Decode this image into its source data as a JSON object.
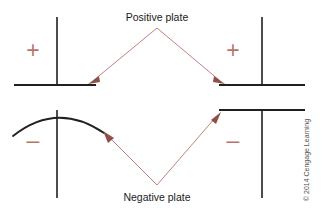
{
  "figure": {
    "title_top": "Positive plate",
    "title_bottom": "Negative plate",
    "credit": "© 2014 Cengage Learning",
    "colors": {
      "accent": "#b5756b",
      "arrow_head": "#8d4f47",
      "wire": "#231f20",
      "label": "#1a1a1a",
      "credit": "#55504e",
      "background": "#ffffff"
    }
  },
  "capacitors": [
    {
      "id": "left",
      "type": "polarized-capacitor",
      "positive_sign": "+",
      "negative_sign": "–",
      "top_plate_style": "straight",
      "bottom_plate_style": "curved"
    },
    {
      "id": "right",
      "type": "nonpolarized-capacitor",
      "positive_sign": "+",
      "negative_sign": "–",
      "top_plate_style": "straight",
      "bottom_plate_style": "straight"
    }
  ],
  "annotations": [
    {
      "id": "positive-left",
      "label": "Positive plate",
      "target": "left capacitor top plate"
    },
    {
      "id": "positive-right",
      "label": "Positive plate",
      "target": "right capacitor top plate"
    },
    {
      "id": "negative-left",
      "label": "Negative plate",
      "target": "left capacitor curved bottom plate"
    },
    {
      "id": "negative-right",
      "label": "Negative plate",
      "target": "right capacitor bottom plate"
    }
  ]
}
